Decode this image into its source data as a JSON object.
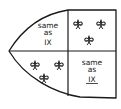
{
  "diagram": {
    "type": "heraldic-shield-quartered",
    "stroke_color": "#1a1a1a",
    "background": "#ffffff",
    "quarters": [
      {
        "position": "top-left",
        "kind": "text",
        "lines": [
          "same",
          "as",
          "IX"
        ],
        "underline_last": false
      },
      {
        "position": "top-right",
        "kind": "charges",
        "charge": "fleur-de-lis",
        "count": 3,
        "arrangement": "2 and 1"
      },
      {
        "position": "bottom-left",
        "kind": "charges",
        "charge": "fleur-de-lis",
        "count": 3,
        "arrangement": "2 and 1"
      },
      {
        "position": "bottom-right",
        "kind": "text",
        "lines": [
          "same",
          "as",
          "IX"
        ],
        "underline_last": true
      }
    ]
  }
}
